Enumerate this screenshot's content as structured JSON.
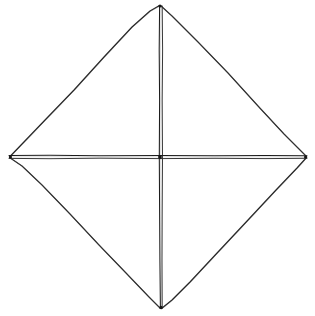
{
  "figure": {
    "kind": "line-drawing",
    "medium": "pen-on-paper",
    "background_color": "#ffffff",
    "stroke_color": "#232323",
    "diagonal_stroke_color": "#1c1c1c",
    "canvas": {
      "width": 315,
      "height": 316
    },
    "vertices": [
      {
        "name": "top",
        "label": "top-vertex",
        "x": 160,
        "y": 5
      },
      {
        "name": "right",
        "label": "right-vertex",
        "x": 307,
        "y": 157
      },
      {
        "name": "bottom",
        "label": "bottom-vertex",
        "x": 161,
        "y": 309
      },
      {
        "name": "left",
        "label": "left-vertex",
        "x": 9,
        "y": 157
      }
    ],
    "center": {
      "name": "center",
      "label": "diagonal-intersection",
      "x": 160,
      "y": 157
    },
    "edges": [
      {
        "name": "upper-left-edge",
        "from": "left",
        "to": "top",
        "path": "M 9.5,157.0 L 22,144 L 46,119 L 74,90 L 104,57 L 132,27 L 150,11 L 159.5,5.5"
      },
      {
        "name": "upper-right-edge",
        "from": "top",
        "to": "right",
        "path": "M 160.5,5.5 L 172,16 L 198,42 L 228,73 L 258,106 L 284,134 L 298,148 L 306.5,156.5"
      },
      {
        "name": "lower-right-edge",
        "from": "right",
        "to": "bottom",
        "path": "M 306.5,157.5 L 297,168 L 276,190 L 248,220 L 218,252 L 190,282 L 172,300 L 161.5,308.5"
      },
      {
        "name": "lower-left-edge",
        "from": "bottom",
        "to": "left",
        "path": "M 160.5,308.5 L 149,297 L 126,273 L 99,245 L 70,214 L 42,185 L 22,166 L 9.5,157.5"
      }
    ],
    "diagonals": [
      {
        "name": "vertical-diagonal",
        "from": "top",
        "to": "bottom",
        "style": "double-stroke",
        "stroke_a": "M 159.6,6 L 159.2,50 L 159.6,100 L 159.3,157 L 159.6,210 L 159.9,260 L 160.4,308",
        "stroke_b": "M 162.2,6 L 162.6,50 L 162.2,100 L 162.5,157 L 162.2,210 L 162.0,260 L 162.2,308"
      },
      {
        "name": "horizontal-diagonal",
        "from": "left",
        "to": "right",
        "style": "double-stroke",
        "stroke_a": "M 9,155.6 L 50,155.3 L 100,155.8 L 160,155.4 L 215,155.7 L 265,155.4 L 307,155.8",
        "stroke_b": "M 9,158.4 L 50,158.7 L 100,158.2 L 160,158.6 L 215,158.3 L 265,158.6 L 307,158.3"
      }
    ],
    "notes": {
      "shape": "rhombus",
      "diagonals_count": 2,
      "regions_count": 4,
      "text_content": "none"
    }
  }
}
